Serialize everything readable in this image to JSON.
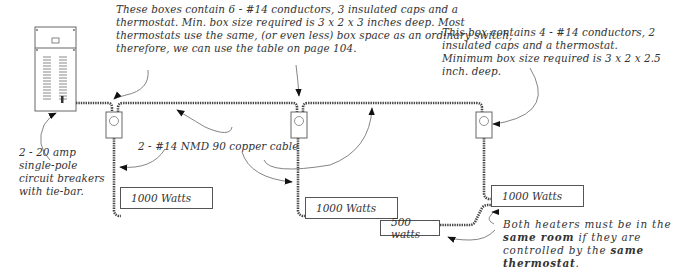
{
  "diagram": {
    "type": "electrical-wiring-diagram",
    "notes": {
      "boxes_note": "These boxes contain 6  - #14 conductors, 3 insulated caps and a thermostat.  Min. box size required is  3 x 2 x 3 inches deep. Most thermostats use the same, (or even less) box space as an ordinary switch, therefore, we can use the table on page 104.",
      "single_box_note": "This box contains 4 - #14 conductors, 2 insulated caps and a thermostat.  Minimum box size required is  3 x 2 x 2.5 inch. deep.",
      "breaker_note": "2 - 20 amp single-pole circuit breakers with tie-bar.",
      "cable_note": "2 - #14 NMD 90 copper cable",
      "same_room_note_parts": {
        "p1": "Both heaters must be in the ",
        "p2": "same room",
        "p3": " if they are controlled by the ",
        "p4": "same thermostat",
        "p5": "."
      }
    },
    "heaters": [
      {
        "label": "1000 Watts"
      },
      {
        "label": "1000 Watts"
      },
      {
        "label": "1000 Watts"
      },
      {
        "label": "500 watts"
      }
    ],
    "components": {
      "panel": "electrical-panel",
      "thermostat_boxes": 3
    }
  }
}
